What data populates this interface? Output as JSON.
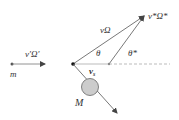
{
  "diagram": {
    "labels": {
      "incoming": "v′Ω′",
      "mass_small": "m",
      "outgoing": "vΩ",
      "cm_velocity": "v*Ω*",
      "theta": "θ",
      "theta_star": "θ*",
      "recoil_velocity": "v",
      "recoil_sub": "s",
      "mass_large": "M"
    },
    "colors": {
      "line": "#555555",
      "dashed": "#999999",
      "circle_fill": "#cccccc",
      "circle_stroke": "#666666"
    }
  }
}
